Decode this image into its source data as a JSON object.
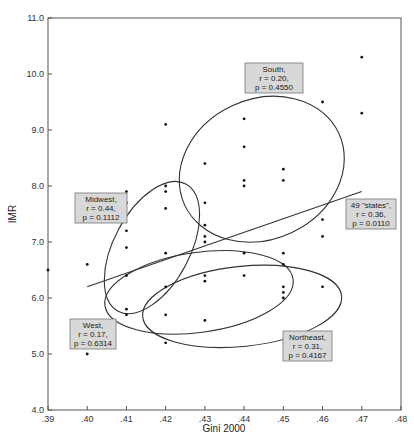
{
  "chart_data": {
    "type": "scatter",
    "title": "",
    "xlabel": "Gini 2000",
    "ylabel": "IMR",
    "xlim": [
      0.39,
      0.48
    ],
    "ylim": [
      4.0,
      11.0
    ],
    "x_ticks": [
      ".39",
      ".40",
      ".41",
      ".42",
      ".43",
      ".44",
      ".45",
      ".46",
      ".47",
      ".48"
    ],
    "y_ticks": [
      "4.0",
      "5.0",
      "6.0",
      "7.0",
      "8.0",
      "9.0",
      "10.0",
      "11.0"
    ],
    "grid": false,
    "points": [
      {
        "x": 0.39,
        "y": 6.5
      },
      {
        "x": 0.4,
        "y": 6.6
      },
      {
        "x": 0.4,
        "y": 5.0
      },
      {
        "x": 0.41,
        "y": 7.9
      },
      {
        "x": 0.41,
        "y": 7.7
      },
      {
        "x": 0.41,
        "y": 7.2
      },
      {
        "x": 0.41,
        "y": 6.9
      },
      {
        "x": 0.41,
        "y": 6.4
      },
      {
        "x": 0.41,
        "y": 5.8
      },
      {
        "x": 0.41,
        "y": 5.7
      },
      {
        "x": 0.42,
        "y": 9.1
      },
      {
        "x": 0.42,
        "y": 8.0
      },
      {
        "x": 0.42,
        "y": 7.9
      },
      {
        "x": 0.42,
        "y": 7.6
      },
      {
        "x": 0.42,
        "y": 6.8
      },
      {
        "x": 0.42,
        "y": 6.2
      },
      {
        "x": 0.42,
        "y": 5.7
      },
      {
        "x": 0.42,
        "y": 5.2
      },
      {
        "x": 0.43,
        "y": 8.4
      },
      {
        "x": 0.43,
        "y": 7.7
      },
      {
        "x": 0.43,
        "y": 7.3
      },
      {
        "x": 0.43,
        "y": 7.1
      },
      {
        "x": 0.43,
        "y": 7.0
      },
      {
        "x": 0.43,
        "y": 6.4
      },
      {
        "x": 0.43,
        "y": 6.3
      },
      {
        "x": 0.43,
        "y": 5.6
      },
      {
        "x": 0.44,
        "y": 9.2
      },
      {
        "x": 0.44,
        "y": 8.7
      },
      {
        "x": 0.44,
        "y": 8.1
      },
      {
        "x": 0.44,
        "y": 8.0
      },
      {
        "x": 0.44,
        "y": 6.8
      },
      {
        "x": 0.44,
        "y": 6.4
      },
      {
        "x": 0.45,
        "y": 8.3
      },
      {
        "x": 0.45,
        "y": 8.1
      },
      {
        "x": 0.45,
        "y": 6.8
      },
      {
        "x": 0.45,
        "y": 6.6
      },
      {
        "x": 0.45,
        "y": 6.2
      },
      {
        "x": 0.45,
        "y": 6.1
      },
      {
        "x": 0.45,
        "y": 6.0
      },
      {
        "x": 0.46,
        "y": 9.5
      },
      {
        "x": 0.46,
        "y": 7.4
      },
      {
        "x": 0.46,
        "y": 7.1
      },
      {
        "x": 0.46,
        "y": 6.2
      },
      {
        "x": 0.47,
        "y": 10.3
      },
      {
        "x": 0.47,
        "y": 9.3
      }
    ],
    "regression_line": {
      "x": [
        0.4,
        0.47
      ],
      "y": [
        6.2,
        7.9
      ]
    },
    "ellipses": [
      {
        "name": "South",
        "cx": 0.4445,
        "cy": 8.3,
        "rx_px": 85,
        "ry_px": 70,
        "rotate_deg": -25
      },
      {
        "name": "Midwest",
        "cx": 0.4165,
        "cy": 6.9,
        "rx_px": 72,
        "ry_px": 38,
        "rotate_deg": -62
      },
      {
        "name": "West",
        "cx": 0.4285,
        "cy": 6.1,
        "rx_px": 95,
        "ry_px": 40,
        "rotate_deg": -8
      },
      {
        "name": "Northeast",
        "cx": 0.4395,
        "cy": 5.85,
        "rx_px": 100,
        "ry_px": 40,
        "rotate_deg": -6
      }
    ],
    "annotations": [
      {
        "id": "south",
        "lines": [
          "South,",
          "r = 0.20,",
          "p = 0.4550"
        ],
        "px": [
          245,
          63,
          58,
          30
        ]
      },
      {
        "id": "midwest",
        "lines": [
          "Midwest,",
          "r = 0.44,",
          "p = 0.1112"
        ],
        "px": [
          75,
          193,
          52,
          30
        ]
      },
      {
        "id": "states",
        "lines": [
          "49 \"states\",",
          "r = 0.36,",
          "p = 0.0110"
        ],
        "px": [
          346,
          199,
          50,
          30
        ]
      },
      {
        "id": "west",
        "lines": [
          "West,",
          "r = 0.17,",
          "p = 0.6314"
        ],
        "px": [
          70,
          319,
          46,
          30
        ]
      },
      {
        "id": "northeast",
        "lines": [
          "Northeast,",
          "r = 0.31,",
          "p = 0.4167"
        ],
        "px": [
          283,
          331,
          49,
          30
        ]
      }
    ]
  }
}
